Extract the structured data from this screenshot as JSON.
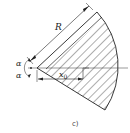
{
  "figure": {
    "caption": "c)",
    "labels": {
      "radius": "R",
      "angle_top": "α",
      "angle_bottom": "α",
      "offset": "x",
      "offset_sub": "0"
    },
    "colors": {
      "stroke": "#222222",
      "hatch": "#333333",
      "background": "#ffffff"
    }
  }
}
